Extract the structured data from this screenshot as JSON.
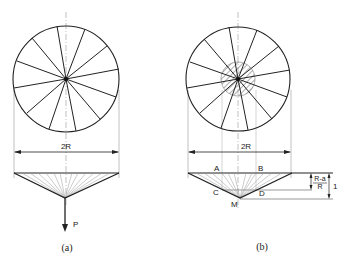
{
  "figure": {
    "panels": [
      {
        "id": "a",
        "caption": "(a)",
        "dimension_label": "2R",
        "load_label": "P"
      },
      {
        "id": "b",
        "caption": "(b)",
        "dimension_label": "2R",
        "point_labels": {
          "A": "A",
          "B": "B",
          "C": "C",
          "D": "D",
          "M": "M"
        },
        "small_dim_numerator": "R-a",
        "small_dim_denominator": "R",
        "total_dim_label": "1"
      }
    ],
    "colors": {
      "line": "#222222",
      "thin": "#888888",
      "background": "#ffffff"
    }
  }
}
